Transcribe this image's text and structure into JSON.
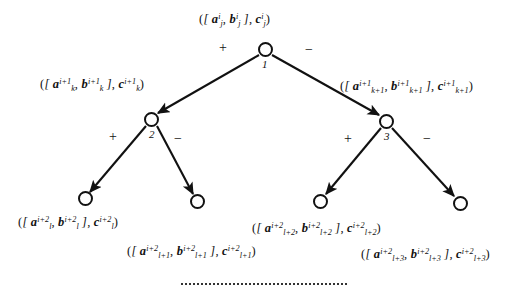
{
  "figure": {
    "width": 519,
    "height": 297,
    "background": "#ffffff",
    "stroke_color": "#111111"
  },
  "nodes": [
    {
      "id": "1",
      "label": "1",
      "cx": 265,
      "cy": 49,
      "r": 7.5,
      "level": 0,
      "kind": "internal"
    },
    {
      "id": "2",
      "label": "2",
      "cx": 151,
      "cy": 119,
      "r": 7.5,
      "level": 1,
      "kind": "internal"
    },
    {
      "id": "3",
      "label": "3",
      "cx": 386,
      "cy": 121,
      "r": 7.5,
      "level": 1,
      "kind": "internal"
    },
    {
      "id": "L1",
      "label": "",
      "cx": 85,
      "cy": 198,
      "r": 7.5,
      "level": 2,
      "kind": "leaf"
    },
    {
      "id": "L2",
      "label": "",
      "cx": 197,
      "cy": 201,
      "r": 7.5,
      "level": 2,
      "kind": "leaf"
    },
    {
      "id": "L3",
      "label": "",
      "cx": 320,
      "cy": 201,
      "r": 7.5,
      "level": 2,
      "kind": "leaf"
    },
    {
      "id": "L4",
      "label": "",
      "cx": 460,
      "cy": 203,
      "r": 7.5,
      "level": 2,
      "kind": "leaf"
    }
  ],
  "edges": [
    {
      "from": "1",
      "to": "2",
      "sign": "+",
      "sign_x": 222,
      "sign_y": 48
    },
    {
      "from": "1",
      "to": "3",
      "sign": "−",
      "sign_y": 50,
      "sign_x": 307
    },
    {
      "from": "2",
      "to": "L1",
      "sign": "+",
      "sign_x": 112,
      "sign_y": 137
    },
    {
      "from": "2",
      "to": "L2",
      "sign": "−",
      "sign_x": 177,
      "sign_y": 137
    },
    {
      "from": "3",
      "to": "L3",
      "sign": "+",
      "sign_x": 347,
      "sign_y": 139
    },
    {
      "from": "3",
      "to": "L4",
      "sign": "−",
      "sign_x": 426,
      "sign_y": 139
    }
  ],
  "labels": {
    "root": {
      "node": "1",
      "text": "( [ a_j^i , b_j^i ] , c_j^i )",
      "a_sub": "j",
      "a_sup": "i",
      "b_sub": "j",
      "b_sup": "i",
      "c_sub": "j",
      "c_sup": "i",
      "x": 199,
      "y": 11
    },
    "left_child": {
      "node": "2",
      "text": "( [ a_k^{i+1} , b_k^{i+1} ] , c_k^{i+1} )",
      "a_sub": "k",
      "a_sup": "i+1",
      "b_sub": "k",
      "b_sup": "i+1",
      "c_sub": "k",
      "c_sup": "i+1",
      "x": 40,
      "y": 76
    },
    "right_child": {
      "node": "3",
      "text": "( [ a_{k+1}^{i+1} , b_{k+1}^{i+1} ] , c_{k+1}^{i+1} )",
      "a_sub": "k+1",
      "a_sup": "i+1",
      "b_sub": "k+1",
      "b_sup": "i+1",
      "c_sub": "k+1",
      "c_sup": "i+1",
      "x": 340,
      "y": 78
    },
    "leaf_1": {
      "node": "L1",
      "text": "( [ a_l^{i+2} , b_l^{i+2} ] , c_l^{i+2} )",
      "a_sub": "l",
      "a_sup": "i+2",
      "b_sub": "l",
      "b_sup": "i+2",
      "c_sub": "l",
      "c_sup": "i+2",
      "x": 18,
      "y": 214
    },
    "leaf_2": {
      "node": "L2",
      "text": "( [ a_{l+1}^{i+2} , b_{l+1}^{i+2} ] , c_{l+1}^{i+2} )",
      "a_sub": "l+1",
      "a_sup": "i+2",
      "b_sub": "l+1",
      "b_sup": "i+2",
      "c_sub": "l+1",
      "c_sup": "i+2",
      "x": 127,
      "y": 243
    },
    "leaf_3": {
      "node": "L3",
      "text": "( [ a_{l+2}^{i+2} , b_{l+2}^{i+2} ] , c_{l+2}^{i+2} )",
      "a_sub": "l+2",
      "a_sup": "i+2",
      "b_sub": "l+2",
      "b_sup": "i+2",
      "c_sub": "l+2",
      "c_sup": "i+2",
      "x": 252,
      "y": 220
    },
    "leaf_4": {
      "node": "L4",
      "text": "( [ a_{l+3}^{i+2} , b_{l+3}^{i+2} ] , c_{l+3}^{i+2} )",
      "a_sub": "l+3",
      "a_sup": "i+2",
      "b_sub": "l+3",
      "b_sup": "i+2",
      "c_sub": "l+3",
      "c_sup": "i+2",
      "x": 361,
      "y": 246
    }
  },
  "continuation_rule": {
    "style": "dotted",
    "x": 181,
    "y": 283,
    "width": 166
  },
  "symbols": {
    "open_paren": "(",
    "close_paren": ")",
    "open_bracket": "[",
    "close_bracket": "]",
    "comma": ",",
    "a": "a",
    "b": "b",
    "c": "c",
    "plus": "+",
    "minus": "−"
  }
}
